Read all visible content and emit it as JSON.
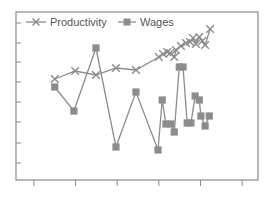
{
  "chart_data": {
    "type": "line",
    "title": "",
    "xlabel": "",
    "ylabel": "",
    "xlim": [
      -0.43,
      5.38
    ],
    "ylim": [
      0,
      8.4
    ],
    "x_ticks": [
      0,
      1,
      2,
      3,
      4,
      5
    ],
    "y_ticks": [
      0.85,
      1.85,
      2.9,
      3.9,
      4.9,
      5.9,
      6.85,
      7.85
    ],
    "x_tick_labels": [],
    "y_tick_labels": [],
    "grid": false,
    "legend": {
      "position": "top-left",
      "orientation": "horizontal"
    },
    "colors": {
      "series": "#8c8c8c",
      "axis": "#8a8a8a",
      "text": "#555555"
    },
    "series": [
      {
        "name": "Productivity",
        "marker": "x",
        "points": [
          [
            0.5,
            5.05
          ],
          [
            0.99,
            5.45
          ],
          [
            1.49,
            5.25
          ],
          [
            1.97,
            5.6
          ],
          [
            2.45,
            5.5
          ],
          [
            3.0,
            6.15
          ],
          [
            3.1,
            6.3
          ],
          [
            3.2,
            6.4
          ],
          [
            3.27,
            6.35
          ],
          [
            3.37,
            6.15
          ],
          [
            3.41,
            6.5
          ],
          [
            3.53,
            6.7
          ],
          [
            3.65,
            6.85
          ],
          [
            3.75,
            6.9
          ],
          [
            3.82,
            7.1
          ],
          [
            3.89,
            6.8
          ],
          [
            3.97,
            7.15
          ],
          [
            4.04,
            6.95
          ],
          [
            4.11,
            6.75
          ],
          [
            4.23,
            7.55
          ]
        ]
      },
      {
        "name": "Wages",
        "marker": "square",
        "points": [
          [
            0.5,
            4.65
          ],
          [
            0.96,
            3.45
          ],
          [
            1.49,
            6.6
          ],
          [
            1.97,
            1.65
          ],
          [
            2.45,
            4.4
          ],
          [
            2.98,
            1.5
          ],
          [
            3.08,
            4.0
          ],
          [
            3.17,
            2.8
          ],
          [
            3.29,
            2.8
          ],
          [
            3.37,
            2.4
          ],
          [
            3.49,
            5.65
          ],
          [
            3.58,
            5.65
          ],
          [
            3.68,
            2.85
          ],
          [
            3.77,
            2.85
          ],
          [
            3.87,
            4.2
          ],
          [
            3.97,
            4.0
          ],
          [
            4.01,
            3.2
          ],
          [
            4.11,
            2.7
          ],
          [
            4.21,
            3.2
          ]
        ]
      }
    ]
  }
}
